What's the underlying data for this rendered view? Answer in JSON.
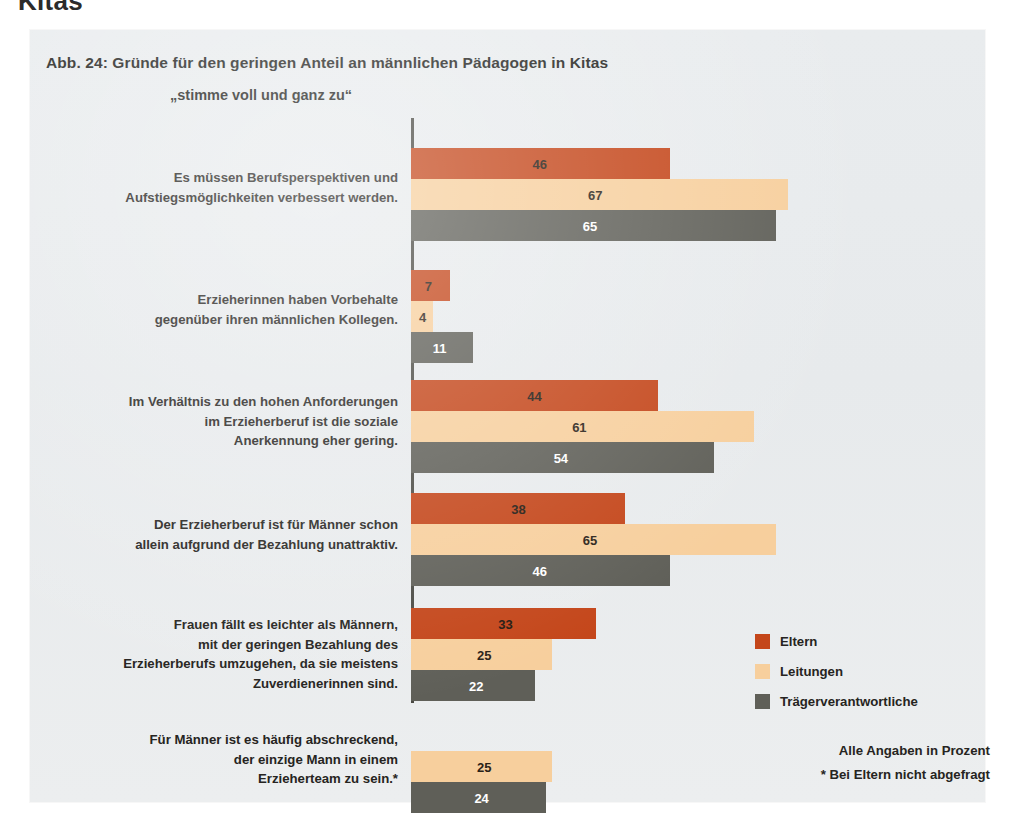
{
  "cropped_header_word": "Kitas",
  "figure": {
    "title": "Abb. 24: Gründe für den geringen Anteil an männlichen Pädagogen in Kitas",
    "subtitle": "„stimme voll und ganz zu“",
    "notes": {
      "unit": "Alle Angaben in Prozent",
      "footnote": "* Bei Eltern nicht abgefragt"
    }
  },
  "legend": {
    "items": [
      {
        "label": "Eltern",
        "color": "#c4461a",
        "key": "eltern"
      },
      {
        "label": "Leitungen",
        "color": "#f7cf9d",
        "key": "leitungen"
      },
      {
        "label": "Trägerverantwortliche",
        "color": "#5f5f58",
        "key": "traeger"
      }
    ]
  },
  "chart_data": {
    "type": "bar",
    "orientation": "horizontal",
    "title": "Abb. 24: Gründe für den geringen Anteil an männlichen Pädagogen in Kitas",
    "subtitle": "„stimme voll und ganz zu“",
    "xlabel": "",
    "ylabel": "",
    "xlim": [
      0,
      70
    ],
    "grid": false,
    "legend_position": "right-bottom",
    "unit": "Prozent",
    "categories": [
      "Es müssen Berufsperspektiven und Aufstiegsmöglichkeiten verbessert werden.",
      "Erzieherinnen haben Vorbehalte gegenüber ihren männlichen Kollegen.",
      "Im Verhältnis zu den hohen Anforderungen im Erzieherberuf ist die soziale Anerkennung eher gering.",
      "Der Erzieherberuf ist für Männer schon allein aufgrund der Bezahlung unattraktiv.",
      "Frauen fällt es leichter als Männern, mit der geringen Bezahlung des Erzieherberufs umzugehen, da sie meistens Zuverdienerinnen sind.",
      "Für Männer ist es häufig abschreckend, der einzige Mann in einem Erzieherteam zu sein.*"
    ],
    "category_lines": [
      [
        "Es müssen Berufsperspektiven und",
        "Aufstiegsmöglichkeiten verbessert werden."
      ],
      [
        "Erzieherinnen haben Vorbehalte",
        "gegenüber ihren männlichen Kollegen."
      ],
      [
        "Im Verhältnis zu den hohen Anforderungen",
        "im Erzieherberuf ist die soziale",
        "Anerkennung eher gering."
      ],
      [
        "Der Erzieherberuf ist für Männer schon",
        "allein aufgrund der Bezahlung unattraktiv."
      ],
      [
        "Frauen fällt es leichter als Männern,",
        "mit der geringen Bezahlung des",
        "Erzieherberufs umzugehen, da sie meistens",
        "Zuverdienerinnen sind."
      ],
      [
        "Für Männer ist es häufig abschreckend,",
        "der einzige Mann in einem",
        "Erzieherteam zu sein.*"
      ]
    ],
    "series": [
      {
        "name": "Eltern",
        "color": "#c4461a",
        "values": [
          46,
          7,
          44,
          38,
          33,
          null
        ]
      },
      {
        "name": "Leitungen",
        "color": "#f7cf9d",
        "values": [
          67,
          4,
          61,
          65,
          25,
          25
        ]
      },
      {
        "name": "Trägerverantwortliche",
        "color": "#5f5f58",
        "values": [
          65,
          11,
          54,
          46,
          22,
          24
        ]
      }
    ]
  },
  "layout": {
    "axis_x": 381,
    "bar_height": 31,
    "px_per_unit": 5.62,
    "group_tops": [
      118,
      240,
      350,
      463,
      578,
      690
    ],
    "label_tops": [
      138,
      260,
      362,
      485,
      585,
      700
    ]
  }
}
